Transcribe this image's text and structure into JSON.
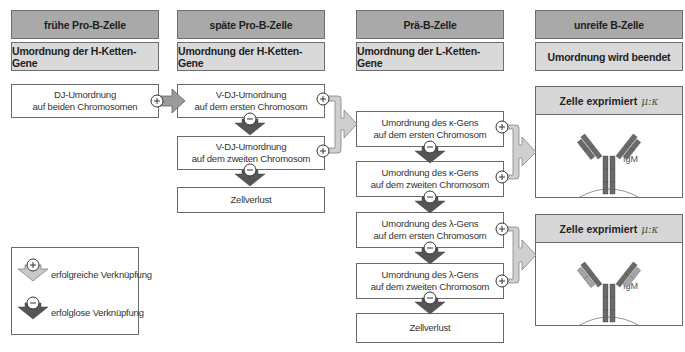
{
  "columns": [
    {
      "stage": "frühe Pro-B-Zelle",
      "process": "Umordnung der H-Ketten-Gene"
    },
    {
      "stage": "späte Pro-B-Zelle",
      "process": "Umordnung der H-Ketten-Gene"
    },
    {
      "stage": "Prä-B-Zelle",
      "process": "Umordnung der L-Ketten-Gene"
    },
    {
      "stage": "unreife B-Zelle",
      "process": "Umordnung wird beendet"
    }
  ],
  "column1": {
    "dj": "DJ-Umordnung\nauf beiden Chromosomen"
  },
  "column2": {
    "vdj1": "V-DJ-Umordnung\nauf dem ersten Chromosom",
    "vdj2": "V-DJ-Umordnung\nauf dem zweiten Chromosom",
    "loss": "Zellverlust"
  },
  "column3": {
    "kappa1": "Umordnung des κ-Gens\nauf dem ersten Chromosom",
    "kappa2": "Umordnung des κ-Gens\nauf dem zweiten Chromosom",
    "lambda1": "Umordnung des λ-Gens\nauf dem ersten Chromosom",
    "lambda2": "Umordnung des λ-Gens\nauf dem zweiten Chromosom",
    "loss": "Zellverlust"
  },
  "column4": {
    "result1": {
      "title": "Zelle exprimiert",
      "chains": "μ:κ",
      "antibody_label": "IgM"
    },
    "result2": {
      "title": "Zelle exprimiert",
      "chains": "μ:κ",
      "antibody_label": "IgM"
    }
  },
  "legend": {
    "success": "erfolgreiche Verknüpfung",
    "failure": "erfolglose Verknüpfung",
    "success_symbol": "+",
    "failure_symbol": "−"
  },
  "colors": {
    "header_dark": "#a9a9a9",
    "header_light": "#d9d9d9",
    "success_arrow": "#c8c8c8",
    "failure_arrow": "#555555",
    "heavy_chain": "#6a6a6a",
    "light_chain_lambda": "#9a9a9a"
  }
}
